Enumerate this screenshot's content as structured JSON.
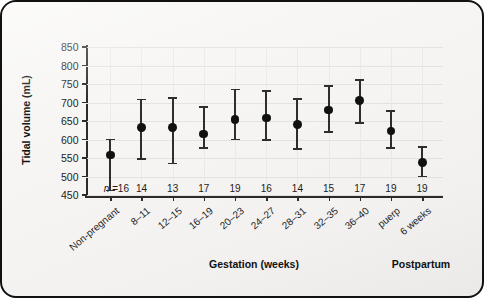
{
  "figure": {
    "background_color": "#f7f6f4",
    "border_color": "#111111",
    "marker_color": "#111111",
    "errorbar_color": "#2e2e2e",
    "gridline_color": "#e6e4e1"
  },
  "axes": {
    "ylabel": "Tidal volume (mL)",
    "xlabel_left": "Gestation (weeks)",
    "xlabel_right": "Postpartum",
    "n_prefix": "n =",
    "yticks": [
      450,
      500,
      550,
      600,
      650,
      700,
      750,
      800,
      850
    ]
  },
  "chart_data": {
    "type": "scatter",
    "title": "",
    "xlabel": "Gestation (weeks) / Postpartum",
    "ylabel": "Tidal volume (mL)",
    "ylim": [
      450,
      850
    ],
    "ytick_step": 50,
    "grid": true,
    "legend": "none",
    "error_type": "error bars (mean with range)",
    "categories": [
      "Non-pregnant",
      "8–11",
      "12–15",
      "16–19",
      "20–23",
      "24–27",
      "28–31",
      "32–35",
      "36–40",
      "puerp",
      "6 weeks"
    ],
    "n": [
      16,
      14,
      13,
      17,
      19,
      16,
      14,
      15,
      17,
      19,
      19
    ],
    "values": [
      558,
      632,
      632,
      615,
      655,
      658,
      640,
      680,
      705,
      623,
      537
    ],
    "err_low": [
      462,
      548,
      535,
      578,
      600,
      598,
      575,
      620,
      645,
      578,
      500
    ],
    "err_high": [
      600,
      708,
      713,
      688,
      735,
      732,
      710,
      745,
      760,
      678,
      580
    ],
    "group_labels": {
      "gestation": [
        "8–11",
        "12–15",
        "16–19",
        "20–23",
        "24–27",
        "28–31",
        "32–35",
        "36–40"
      ],
      "postpartum": [
        "puerp",
        "6 weeks"
      ],
      "baseline": [
        "Non-pregnant"
      ]
    }
  }
}
